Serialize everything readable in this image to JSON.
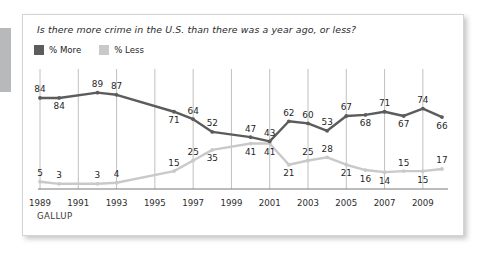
{
  "card": {
    "title": "Is there more crime in the U.S. than there was a year ago, or less?",
    "source": "GALLUP"
  },
  "legend": {
    "position": "top-left",
    "entries": [
      {
        "label": "% More",
        "color": "#5c5c5c",
        "swatch_name": "legend-swatch-more"
      },
      {
        "label": "% Less",
        "color": "#c9c9c9",
        "swatch_name": "legend-swatch-less"
      }
    ]
  },
  "colors": {
    "more_line": "#5c5c5c",
    "less_line": "#c9c9c9",
    "gridline": "#c0c0c0",
    "axis": "#7a7a7a",
    "card_border": "#d4d4d4",
    "edge_bar": "#b7b9bb",
    "label_text": "#1f1f1f"
  },
  "chart_data": {
    "type": "line",
    "title": "Is there more crime in the U.S. than there was a year ago, or less?",
    "xlabel": "",
    "ylabel": "",
    "ylim": [
      0,
      100
    ],
    "grid": "vertical-only",
    "x": [
      1989,
      1990,
      1992,
      1993,
      1996,
      1997,
      1998,
      2000,
      2001,
      2002,
      2003,
      2004,
      2005,
      2006,
      2007,
      2008,
      2009,
      2010
    ],
    "tick_labels": [
      "1989",
      "1991",
      "1993",
      "1995",
      "1997",
      "1999",
      "2001",
      "2003",
      "2005",
      "2007",
      "2009"
    ],
    "series": [
      {
        "name": "% More",
        "color": "#5c5c5c",
        "values": [
          84,
          84,
          89,
          87,
          71,
          64,
          52,
          47,
          43,
          62,
          60,
          53,
          67,
          68,
          71,
          67,
          74,
          66
        ]
      },
      {
        "name": "% Less",
        "color": "#c9c9c9",
        "values": [
          5,
          3,
          3,
          4,
          15,
          25,
          35,
          41,
          41,
          21,
          25,
          28,
          21,
          16,
          14,
          15,
          15,
          17
        ]
      }
    ],
    "point_labels": {
      "more": [
        {
          "value": 84,
          "pos": "above"
        },
        {
          "value": 84,
          "pos": "below"
        },
        {
          "value": 89,
          "pos": "above"
        },
        {
          "value": 87,
          "pos": "above"
        },
        {
          "value": 71,
          "pos": "below"
        },
        {
          "value": 64,
          "pos": "above"
        },
        {
          "value": 52,
          "pos": "above"
        },
        {
          "value": 47,
          "pos": "above"
        },
        {
          "value": 43,
          "pos": "above"
        },
        {
          "value": 62,
          "pos": "above"
        },
        {
          "value": 60,
          "pos": "above"
        },
        {
          "value": 53,
          "pos": "above"
        },
        {
          "value": 67,
          "pos": "above"
        },
        {
          "value": 68,
          "pos": "below"
        },
        {
          "value": 71,
          "pos": "above"
        },
        {
          "value": 67,
          "pos": "below"
        },
        {
          "value": 74,
          "pos": "above"
        },
        {
          "value": 66,
          "pos": "below"
        }
      ],
      "less": [
        {
          "value": 5,
          "pos": "above"
        },
        {
          "value": 3,
          "pos": "above"
        },
        {
          "value": 3,
          "pos": "above"
        },
        {
          "value": 4,
          "pos": "above"
        },
        {
          "value": 15,
          "pos": "above"
        },
        {
          "value": 25,
          "pos": "above"
        },
        {
          "value": 35,
          "pos": "below"
        },
        {
          "value": 41,
          "pos": "below"
        },
        {
          "value": 41,
          "pos": "below"
        },
        {
          "value": 21,
          "pos": "below"
        },
        {
          "value": 25,
          "pos": "above"
        },
        {
          "value": 28,
          "pos": "above"
        },
        {
          "value": 21,
          "pos": "below"
        },
        {
          "value": 16,
          "pos": "below"
        },
        {
          "value": 14,
          "pos": "below"
        },
        {
          "value": 15,
          "pos": "above"
        },
        {
          "value": 15,
          "pos": "below"
        },
        {
          "value": 17,
          "pos": "above"
        }
      ]
    }
  }
}
